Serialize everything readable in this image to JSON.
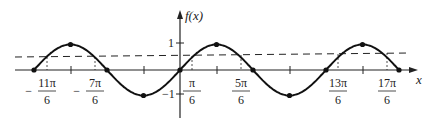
{
  "chart_data": {
    "type": "line",
    "title": "",
    "xlabel": "x",
    "ylabel": "f(x)",
    "function": "sin(x)",
    "x_range": [
      "-2π",
      "3π"
    ],
    "ylim": [
      -1,
      1
    ],
    "grid": false,
    "series": [
      {
        "name": "f(x)",
        "style": "solid",
        "marked_points": [
          {
            "x": "-2π",
            "y": 0
          },
          {
            "x": "-3π/2",
            "y": 1
          },
          {
            "x": "-π",
            "y": 0
          },
          {
            "x": "-π/2",
            "y": -1
          },
          {
            "x": "0",
            "y": 0
          },
          {
            "x": "π/2",
            "y": 1
          },
          {
            "x": "π",
            "y": 0
          },
          {
            "x": "3π/2",
            "y": -1
          },
          {
            "x": "2π",
            "y": 0
          },
          {
            "x": "5π/2",
            "y": 1
          },
          {
            "x": "3π",
            "y": 0
          }
        ]
      },
      {
        "name": "y = 1/2",
        "style": "dashed",
        "value": 0.5
      }
    ],
    "y_ticks": [
      {
        "value": 1,
        "label": "1"
      },
      {
        "value": -1,
        "label": "-1"
      }
    ],
    "x_tick_labels": [
      {
        "sign": "−",
        "num": "11π",
        "den": "6"
      },
      {
        "sign": "−",
        "num": "7π",
        "den": "6"
      },
      {
        "sign": "",
        "num": "π",
        "den": "6"
      },
      {
        "sign": "",
        "num": "5π",
        "den": "6"
      },
      {
        "sign": "",
        "num": "13π",
        "den": "6"
      },
      {
        "sign": "",
        "num": "17π",
        "den": "6"
      }
    ]
  }
}
